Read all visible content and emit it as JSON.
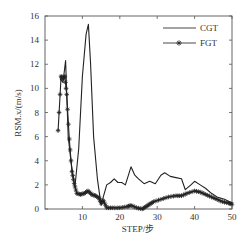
{
  "chart_data": {
    "type": "line",
    "title": "",
    "xlabel": "STEP/步",
    "ylabel": "RSM.x/(m/s)",
    "xlim": [
      0,
      50
    ],
    "ylim": [
      0,
      16
    ],
    "xticks": [
      10,
      20,
      30,
      40,
      50
    ],
    "yticks": [
      0,
      2,
      4,
      6,
      8,
      10,
      12,
      14,
      16
    ],
    "grid": false,
    "legend_position": "upper right",
    "series": [
      {
        "name": "CGT",
        "marker": "none",
        "color": "#222222",
        "x": [
          4,
          4.8,
          5.5,
          6.2,
          7,
          8,
          9,
          10,
          11,
          11.6,
          12.2,
          13,
          14,
          15,
          15.6,
          16.5,
          17.5,
          18.5,
          19.5,
          20.5,
          21.5,
          23,
          24,
          25,
          26.5,
          28,
          29.5,
          31,
          32,
          33.5,
          35,
          36.5,
          37.5,
          39,
          40,
          41.5,
          43,
          44.5,
          46,
          48,
          50
        ],
        "y": [
          10.8,
          10.5,
          12.3,
          6.0,
          3.8,
          1.8,
          5.0,
          11.0,
          14.5,
          15.3,
          12.0,
          6.0,
          2.5,
          0.3,
          1.0,
          2.0,
          2.2,
          2.5,
          2.2,
          2.2,
          2.0,
          3.5,
          2.8,
          2.5,
          2.1,
          2.3,
          2.1,
          2.8,
          3.0,
          2.7,
          2.6,
          2.5,
          1.6,
          2.0,
          2.3,
          2.0,
          1.7,
          1.3,
          1.0,
          0.8,
          0.5
        ]
      },
      {
        "name": "FGT",
        "marker": "star",
        "color": "#222222",
        "x": [
          3.5,
          4.3,
          4.8,
          5.3,
          5.8,
          6.5,
          7.2,
          7.8,
          8.5,
          9.5,
          10.5,
          11.5,
          12.5,
          13.5,
          14.5,
          15,
          15.6,
          16.5,
          18,
          20,
          22,
          23,
          24.5,
          26,
          27,
          28,
          29,
          31,
          33,
          35,
          36.5,
          38,
          40,
          41.5,
          43,
          44.5,
          46,
          47.5,
          49,
          50
        ],
        "y": [
          6.5,
          11.0,
          10.8,
          11.0,
          9.5,
          5.8,
          3.1,
          2.1,
          1.3,
          1.2,
          1.3,
          1.5,
          1.2,
          1.1,
          0.9,
          0.5,
          0.7,
          0.1,
          0.1,
          0.1,
          0.2,
          0.3,
          0.1,
          0.0,
          0.2,
          0.4,
          0.6,
          0.8,
          1.0,
          1.1,
          1.1,
          1.3,
          1.5,
          1.4,
          1.2,
          1.0,
          0.8,
          0.6,
          0.5,
          0.4
        ]
      }
    ]
  },
  "legend": {
    "items": [
      {
        "label": "CGT"
      },
      {
        "label": "FGT"
      }
    ]
  }
}
